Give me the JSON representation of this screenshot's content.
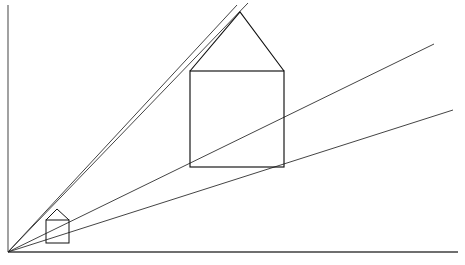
{
  "figure": {
    "canvas": {
      "width": 465,
      "height": 265
    },
    "background_color": "#ffffff",
    "line_color": "#111111",
    "frame_color": "#555555"
  },
  "chart_data": {
    "type": "scatter",
    "xlabel": "",
    "ylabel": "",
    "grid": false,
    "legend": "none",
    "xlim": [
      0,
      465
    ],
    "ylim": [
      0,
      265
    ],
    "note": "Coordinates are in pixel space with origin at top-left of the 465x265 canvas.",
    "vanishing_point": {
      "label": "station point",
      "x": 8,
      "y": 252
    },
    "frame": {
      "left_axis": {
        "x1": 8,
        "y1": 5,
        "x2": 8,
        "y2": 252
      },
      "bottom_axis": {
        "x1": 8,
        "y1": 252,
        "x2": 458,
        "y2": 252
      }
    },
    "rays": [
      {
        "name": "ray-roof-apex-upper",
        "x1": 8,
        "y1": 252,
        "x2": 248,
        "y2": 3
      },
      {
        "name": "ray-roof-apex-lower",
        "x1": 8,
        "y1": 252,
        "x2": 237,
        "y2": 5
      },
      {
        "name": "ray-top-right-corner",
        "x1": 8,
        "y1": 252,
        "x2": 434,
        "y2": 44
      },
      {
        "name": "ray-bottom-right-corner",
        "x1": 8,
        "y1": 252,
        "x2": 453,
        "y2": 110
      },
      {
        "name": "ray-baseline",
        "x1": 8,
        "y1": 252,
        "x2": 458,
        "y2": 252
      }
    ],
    "figures": [
      {
        "name": "small-house",
        "description": "near projected house close to the vanishing point",
        "square": {
          "left": 46,
          "right": 69,
          "top": 220,
          "bottom": 243
        },
        "roof_apex": {
          "x": 57,
          "y": 209
        },
        "vertices": [
          [
            46,
            220
          ],
          [
            69,
            220
          ],
          [
            69,
            243
          ],
          [
            46,
            243
          ],
          [
            57,
            209
          ]
        ]
      },
      {
        "name": "large-house",
        "description": "far projected house scaled along the sight lines",
        "square": {
          "left": 190,
          "right": 284,
          "top": 71,
          "bottom": 167
        },
        "roof_apex": {
          "x": 240,
          "y": 12
        },
        "vertices": [
          [
            190,
            71
          ],
          [
            284,
            71
          ],
          [
            284,
            167
          ],
          [
            190,
            167
          ],
          [
            240,
            12
          ]
        ]
      }
    ]
  },
  "elements": {
    "frame_name": "figure-frame",
    "rays_group_name": "sight-ray-group",
    "small_house_name": "small-house-shape",
    "large_house_name": "large-house-shape",
    "vanishing_point_name": "vanishing-point"
  }
}
